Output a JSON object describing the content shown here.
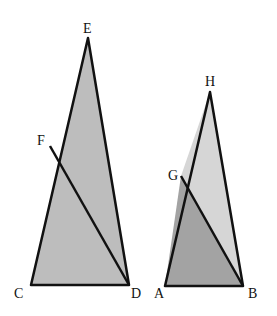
{
  "diagram": {
    "colors": {
      "left_triangle": "#bdbdbd",
      "right_upper": "#d6d6d6",
      "right_lower": "#a3a3a3",
      "stroke": "#111111"
    },
    "left_figure": {
      "points": {
        "C": [
          31,
          285
        ],
        "D": [
          129,
          285
        ],
        "E": [
          88,
          38
        ],
        "F": [
          50,
          146
        ]
      },
      "labels": {
        "C": "C",
        "D": "D",
        "E": "E",
        "F": "F"
      }
    },
    "right_figure": {
      "points": {
        "A": [
          165,
          286
        ],
        "B": [
          243,
          286
        ],
        "H": [
          210,
          92
        ],
        "G": [
          181,
          176
        ]
      },
      "labels": {
        "A": "A",
        "B": "B",
        "G": "G",
        "H": "H"
      }
    }
  }
}
